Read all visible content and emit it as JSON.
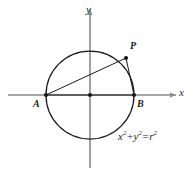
{
  "figure": {
    "background_color": "#ffffff",
    "stroke_color": "#1a1a1a",
    "axis_color": "#808080",
    "axes": {
      "x_label": "x",
      "y_label": "y",
      "x_range_px": [
        8,
        176
      ],
      "y_range_px": [
        8,
        168
      ],
      "origin_px": [
        90,
        95
      ]
    },
    "circle": {
      "center_px": [
        90,
        95
      ],
      "radius_px": 44,
      "equation_parts": {
        "x_var": "x",
        "x_exp": "2",
        "plus": "+",
        "y_var": "y",
        "y_exp": "2",
        "equals": "=",
        "r_var": "r",
        "r_exp": "2"
      },
      "equation_text": "x²+y²=r²"
    },
    "points": [
      {
        "id": "A",
        "label": "A",
        "x_px": 46,
        "y_px": 95,
        "label_x_px": 33,
        "label_y_px": 99
      },
      {
        "id": "B",
        "label": "B",
        "x_px": 134,
        "y_px": 95,
        "label_x_px": 137,
        "label_y_px": 99
      },
      {
        "id": "P",
        "label": "P",
        "x_px": 126,
        "y_px": 58,
        "label_x_px": 130,
        "label_y_px": 43
      },
      {
        "id": "O",
        "label": "",
        "x_px": 90,
        "y_px": 95,
        "label_x_px": 0,
        "label_y_px": 0
      }
    ],
    "segments": [
      {
        "id": "AP",
        "from": "A",
        "to": "P"
      },
      {
        "id": "PB",
        "from": "P",
        "to": "B"
      },
      {
        "id": "AB",
        "from": "A",
        "to": "B"
      }
    ]
  }
}
